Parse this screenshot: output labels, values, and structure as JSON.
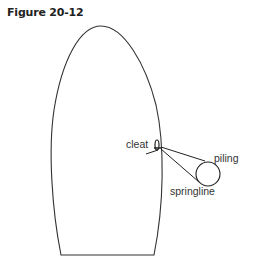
{
  "figure": {
    "title": "Figure 20-12",
    "labels": {
      "cleat": "cleat",
      "piling": "piling",
      "springline": "springline"
    }
  }
}
